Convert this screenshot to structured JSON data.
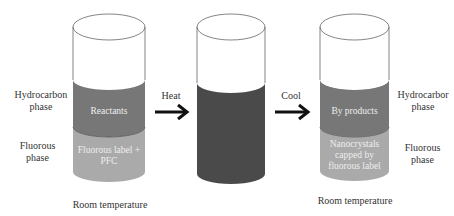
{
  "left": {
    "side_labels": {
      "hydrocarbon": "Hydrocarbon\nphase",
      "fluorous": "Fluorous\nphase"
    },
    "top_layer": "Reactants",
    "bottom_layer": "Fluorous label +\nPFC",
    "caption": "Room temperature"
  },
  "arrow1": {
    "label": "Heat"
  },
  "middle": {
    "caption": ""
  },
  "arrow2": {
    "label": "Cool"
  },
  "right": {
    "side_labels": {
      "hydrocarbon": "Hydrocarbor\nphase",
      "fluorous": "Fluorous\nphase"
    },
    "top_layer": "By products",
    "bottom_layer": "Nanocrystals\ncapped by\nfluorous label",
    "caption": "Room temperature"
  },
  "colors": {
    "hydrocarbon": "#777777",
    "fluorous": "#aaaaaa",
    "mixed": "#4a4a4a",
    "outline": "#555555",
    "arrow": "#111111"
  }
}
